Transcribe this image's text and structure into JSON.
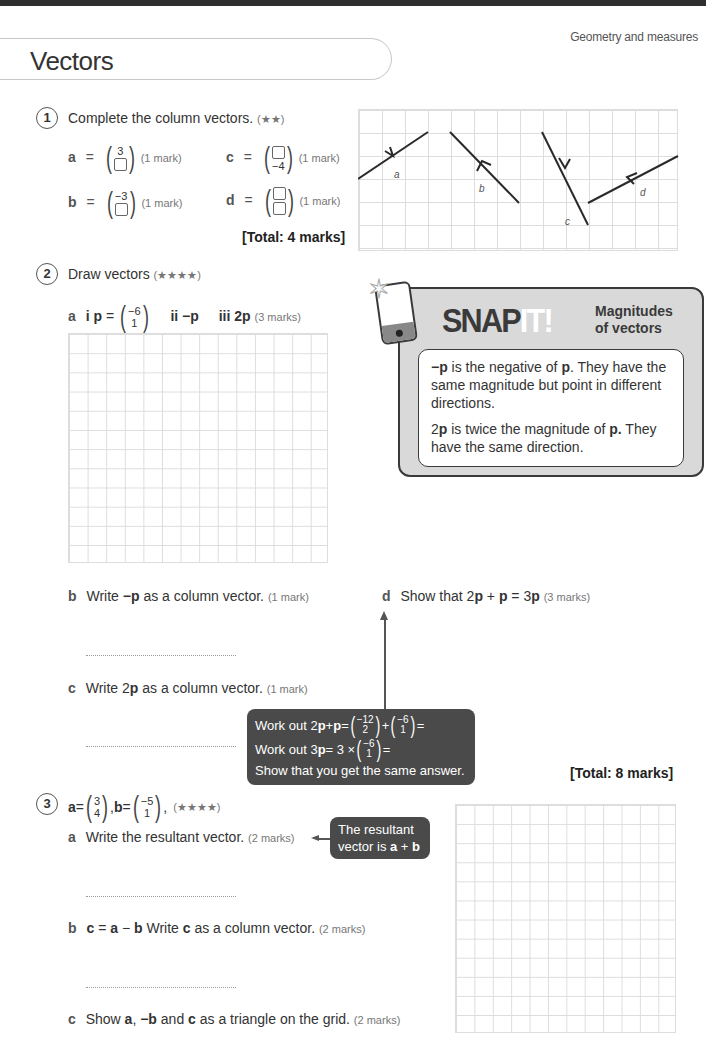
{
  "header": {
    "topic": "Geometry and measures",
    "title": "Vectors"
  },
  "q1": {
    "number": "1",
    "prompt": "Complete the column vectors.",
    "stars": "(★★)",
    "items": [
      {
        "label": "a",
        "top": "3",
        "bottom": "",
        "marks": "(1 mark)"
      },
      {
        "label": "b",
        "top": "−3",
        "bottom": "",
        "marks": "(1 mark)"
      },
      {
        "label": "c",
        "top": "",
        "bottom": "−4",
        "marks": "(1 mark)"
      },
      {
        "label": "d",
        "top": "",
        "bottom": "",
        "marks": "(1 mark)"
      }
    ],
    "total": "[Total: 4 marks]",
    "diagram_labels": {
      "a": "a",
      "b": "b",
      "c": "c",
      "d": "d"
    }
  },
  "q2": {
    "number": "2",
    "prompt": "Draw vectors",
    "stars": "(★★★★)",
    "a": {
      "label": "a",
      "i": "i",
      "p_name": "p",
      "eq": "=",
      "p_top": "−6",
      "p_bottom": "1",
      "ii": "ii",
      "ii_text": "−p",
      "iii": "iii",
      "iii_text": "2p",
      "marks": "(3 marks)"
    },
    "b": {
      "label": "b",
      "pre": "Write ",
      "bold": "−p",
      "post": " as a column vector.",
      "marks": "(1 mark)"
    },
    "c": {
      "label": "c",
      "pre": "Write 2",
      "bold": "p",
      "post": " as a column vector.",
      "marks": "(1 mark)"
    },
    "d": {
      "label": "d",
      "text1": "Show that 2",
      "b1": "p",
      "text2": " + ",
      "b2": "p",
      "text3": " = 3",
      "b3": "p",
      "marks": "(3 marks)"
    },
    "total": "[Total: 8 marks]",
    "hint": {
      "line1_pre": "Work out 2",
      "line1_b1": "p",
      "line1_mid": " + ",
      "line1_b2": "p",
      "line1_eq": " = ",
      "v1_top": "−12",
      "v1_bottom": "2",
      "plus": " + ",
      "v2_top": "−6",
      "v2_bottom": "1",
      "line1_end": " =",
      "line2_pre": "Work out 3",
      "line2_b": "p",
      "line2_mid": " = 3 × ",
      "v3_top": "−6",
      "v3_bottom": "1",
      "line2_end": " =",
      "line3": "Show that you get the same answer."
    }
  },
  "snapit": {
    "title_dark": "SNAP",
    "title_light": "IT!",
    "subtitle_1": "Magnitudes",
    "subtitle_2": "of vectors",
    "p1_b": "−p",
    "p1_mid": " is the negative of ",
    "p1_b2": "p",
    "p1_end": ". They have the same magnitude but point in different directions.",
    "p2_pre": "2",
    "p2_b": "p",
    "p2_mid": " is twice the magnitude of ",
    "p2_b2": "p.",
    "p2_end": " They have the same direction."
  },
  "q3": {
    "number": "3",
    "a_name": "a",
    "eq": " = ",
    "a_top": "3",
    "a_bottom": "4",
    "comma": ", ",
    "b_name": "b",
    "b_top": "−5",
    "b_bottom": "1",
    "end": ",",
    "stars": "(★★★★)",
    "a": {
      "label": "a",
      "text": "Write the resultant vector.",
      "marks": "(2 marks)"
    },
    "hint": {
      "line1": "The resultant",
      "line2_pre": "vector is ",
      "b1": "a",
      "plus": " + ",
      "b2": "b"
    },
    "b": {
      "label": "b",
      "b1": "c",
      "eq": " = ",
      "b2": "a",
      "minus": " − ",
      "b3": "b",
      "text": " Write ",
      "b4": "c",
      "text2": " as a column vector.",
      "marks": "(2 marks)"
    },
    "c": {
      "label": "c",
      "pre": "Show ",
      "b1": "a",
      "mid1": ", ",
      "b2": "−b",
      "mid2": " and ",
      "b3": "c",
      "post": " as a triangle on the grid.",
      "marks": "(2 marks)"
    }
  }
}
